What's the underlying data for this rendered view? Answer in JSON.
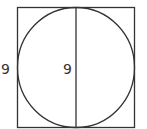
{
  "diagram": {
    "square_side_label": "9",
    "diameter_label": "9",
    "stroke_color": "#333333"
  }
}
